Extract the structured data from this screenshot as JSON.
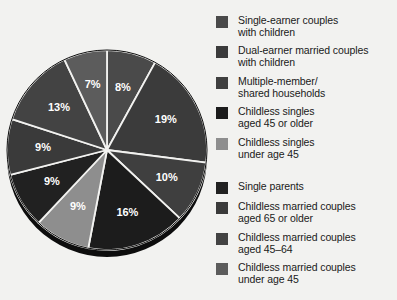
{
  "chart_data": {
    "type": "pie",
    "title": "",
    "subtitle": "",
    "xlabel": "",
    "ylabel": "",
    "legend_position": "right",
    "grid": false,
    "value_suffix": "%",
    "start_angle_deg": 0,
    "direction": "clockwise",
    "categories": [
      "Single-earner couples with children",
      "Dual-earner married couples with children",
      "Multiple-member/ shared households",
      "Childless singles aged 45 or older",
      "Childless singles under age 45",
      "Single parents",
      "Childless married couples aged 65 or older",
      "Childless married couples aged 45–64",
      "Childless married couples under age 45"
    ],
    "values": [
      8,
      19,
      10,
      16,
      9,
      9,
      9,
      13,
      7
    ],
    "labels": [
      "8%",
      "19%",
      "10%",
      "16%",
      "9%",
      "9%",
      "9%",
      "13%",
      "7%"
    ],
    "colors": [
      "#4a4a4a",
      "#3b3b3b",
      "#3f3f3f",
      "#1c1c1c",
      "#8e8e8e",
      "#212121",
      "#3a3a3a",
      "#434343",
      "#5c5c5c"
    ],
    "total": 100
  },
  "pie": {
    "center_x": 107,
    "center_y": 150,
    "radius": 100,
    "depth": 7,
    "separator_color": "#f2f2f0",
    "separator_width": 1.8,
    "rim_color": "#0d0d0d",
    "label_color": "#ffffff",
    "slices": [
      {
        "label": "8%",
        "value": 8,
        "color": "#4a4a4a",
        "label_r": 0.64
      },
      {
        "label": "19%",
        "value": 19,
        "color": "#3b3b3b",
        "label_r": 0.66
      },
      {
        "label": "10%",
        "value": 10,
        "color": "#3f3f3f",
        "label_r": 0.66
      },
      {
        "label": "16%",
        "value": 16,
        "color": "#1c1c1c",
        "label_r": 0.66
      },
      {
        "label": "9%",
        "value": 9,
        "color": "#8e8e8e",
        "label_r": 0.64
      },
      {
        "label": "9%",
        "value": 9,
        "color": "#212121",
        "label_r": 0.64
      },
      {
        "label": "9%",
        "value": 9,
        "color": "#3a3a3a",
        "label_r": 0.64
      },
      {
        "label": "13%",
        "value": 13,
        "color": "#434343",
        "label_r": 0.64
      },
      {
        "label": "7%",
        "value": 7,
        "color": "#5c5c5c",
        "label_r": 0.66
      }
    ]
  },
  "legend": {
    "items": [
      {
        "label": "Single-earner couples\nwith children",
        "color": "#4a4a4a",
        "top": 14
      },
      {
        "label": "Dual-earner married couples\nwith children",
        "color": "#3b3b3b",
        "top": 44
      },
      {
        "label": "Multiple-member/\nshared households",
        "color": "#3f3f3f",
        "top": 75
      },
      {
        "label": "Childless singles\naged 45 or older",
        "color": "#1c1c1c",
        "top": 105
      },
      {
        "label": "Childless singles\nunder age 45",
        "color": "#8e8e8e",
        "top": 136
      },
      {
        "label": "Single parents",
        "color": "#212121",
        "top": 180
      },
      {
        "label": "Childless married couples\naged 65 or older",
        "color": "#3a3a3a",
        "top": 200
      },
      {
        "label": "Childless married couples\naged 45–64",
        "color": "#434343",
        "top": 231
      },
      {
        "label": "Childless married couples\nunder age 45",
        "color": "#5c5c5c",
        "top": 261
      }
    ]
  },
  "background_color": "#f2f2f0"
}
